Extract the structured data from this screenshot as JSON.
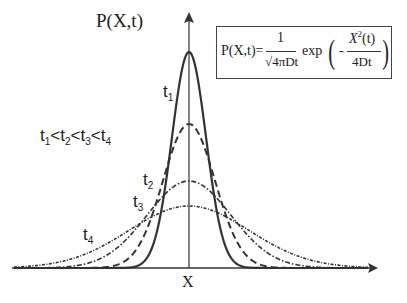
{
  "diagram": {
    "y_axis_label": "P(X,t)",
    "x_axis_label": "X",
    "ordering_label": {
      "t1": "t",
      "s1": "1",
      "lt1": "<",
      "t2": "t",
      "s2": "2",
      "lt2": "<",
      "t3": "t",
      "s3": "3",
      "lt3": "<",
      "t4": "t",
      "s4": "4"
    },
    "curves": [
      {
        "name": "t",
        "sub": "1",
        "style": "solid"
      },
      {
        "name": "t",
        "sub": "2",
        "style": "dashed"
      },
      {
        "name": "t",
        "sub": "3",
        "style": "dash-dot"
      },
      {
        "name": "t",
        "sub": "4",
        "style": "dotted"
      }
    ],
    "formula": {
      "lhs": "P(X,t)=",
      "numerator": "1",
      "denominator": "√4πDt",
      "exp": "exp",
      "minus": "-",
      "exp_numerator_base": "X",
      "exp_numerator_sup": "2",
      "exp_numerator_arg": "(t)",
      "exp_denominator": "4Dt"
    }
  }
}
